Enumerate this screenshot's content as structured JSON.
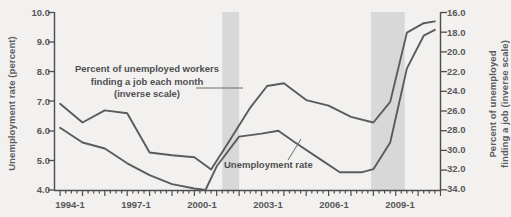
{
  "chart_data": {
    "type": "line",
    "title": "",
    "xlabel": "",
    "x_tick_labels": [
      "1994-1",
      "1997-1",
      "2000-1",
      "2003-1",
      "2006-1",
      "2009-1"
    ],
    "x_tick_values": [
      1994.0,
      1997.0,
      2000.0,
      2003.0,
      2006.0,
      2009.0
    ],
    "xlim": [
      1993.75,
      2011.0
    ],
    "grid": false,
    "legend_position": "inline-annotations",
    "axes": [
      {
        "id": "left",
        "label": "Unemployment rate (percent)",
        "ylim": [
          4.0,
          10.0
        ],
        "inverted": false,
        "tick_labels": [
          "10.0",
          "9.0",
          "8.0",
          "7.0",
          "6.0",
          "5.0",
          "4.0"
        ],
        "tick_values": [
          10.0,
          9.0,
          8.0,
          7.0,
          6.0,
          5.0,
          4.0
        ]
      },
      {
        "id": "right",
        "label": "Percent of unemployed finding a job (inverse scale)",
        "label_line1": "Percent of unemployed",
        "label_line2": "finding a job (inverse scale)",
        "ylim": [
          16.0,
          35.0
        ],
        "inverted": true,
        "tick_labels": [
          "16.0",
          "18.0",
          "20.0",
          "22.0",
          "24.0",
          "26.0",
          "28.0",
          "30.0",
          "32.0",
          "34.0"
        ],
        "tick_values": [
          16.0,
          18.0,
          20.0,
          22.0,
          24.0,
          26.0,
          28.0,
          30.0,
          32.0,
          34.0
        ]
      }
    ],
    "series": [
      {
        "name": "Unemployment rate",
        "axis": "left",
        "color": "#5b5b5b",
        "x": [
          1994.0,
          1995.0,
          1996.0,
          1997.0,
          1998.0,
          1999.0,
          2000.0,
          2000.5,
          2001.0,
          2002.0,
          2003.0,
          2003.75,
          2004.5,
          2005.5,
          2006.5,
          2007.5,
          2008.0,
          2008.75,
          2009.5,
          2010.25,
          2010.75
        ],
        "values": [
          6.1,
          5.6,
          5.4,
          4.9,
          4.5,
          4.2,
          4.05,
          4.0,
          4.8,
          5.8,
          5.9,
          6.0,
          5.6,
          5.1,
          4.6,
          4.6,
          4.7,
          5.6,
          8.1,
          9.2,
          9.4
        ]
      },
      {
        "name": "Percent of unemployed workers finding a job each month (inverse scale)",
        "axis": "right",
        "color": "#5b5b5b",
        "x": [
          1994.0,
          1995.0,
          1996.0,
          1997.0,
          1998.0,
          1999.0,
          2000.0,
          2000.75,
          2001.5,
          2002.5,
          2003.25,
          2004.0,
          2005.0,
          2006.0,
          2007.0,
          2008.0,
          2008.75,
          2009.5,
          2010.25,
          2010.75
        ],
        "values": [
          25.8,
          27.8,
          26.5,
          26.8,
          31.0,
          31.3,
          31.5,
          32.8,
          30.0,
          26.2,
          23.9,
          23.6,
          25.4,
          26.0,
          27.2,
          27.8,
          25.6,
          18.2,
          17.2,
          17.0
        ]
      }
    ],
    "shaded_regions": [
      {
        "name": "recession-2001",
        "x_start": 2001.25,
        "x_end": 2002.0,
        "color": "#d8d8d8"
      },
      {
        "name": "recession-2008",
        "x_start": 2007.9,
        "x_end": 2009.4,
        "color": "#d8d8d8"
      }
    ],
    "annotations": [
      {
        "name": "job-finding-annotation",
        "line1": "Percent of unemployed workers",
        "line2": "finding a job each month",
        "line3": "(inverse scale)",
        "leader": true
      },
      {
        "name": "unemployment-rate-annotation",
        "text": "Unemployment rate",
        "leader": true
      }
    ]
  }
}
